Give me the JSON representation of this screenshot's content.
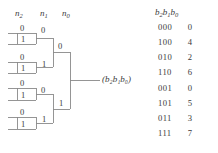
{
  "figure": {
    "type": "binary-decision-tree",
    "root_label": "(b₂b₁b₀)",
    "line_color": "#8a8a8a",
    "text_color": "#3a3a3a",
    "background": "#ffffff"
  },
  "headers": [
    {
      "name": "n2",
      "base": "n",
      "sub": "2"
    },
    {
      "name": "n1",
      "base": "n",
      "sub": "1"
    },
    {
      "name": "n0",
      "base": "n",
      "sub": "0"
    }
  ],
  "tree": {
    "leaf_groups": [
      {
        "id": "g1",
        "top_label": "0",
        "bottom_label": "1"
      },
      {
        "id": "g2",
        "top_label": "0",
        "bottom_label": "1"
      },
      {
        "id": "g3",
        "top_label": "0",
        "bottom_label": "1"
      },
      {
        "id": "g4",
        "top_label": "0",
        "bottom_label": "1"
      }
    ],
    "level2_labels": [
      {
        "id": "n1-a",
        "label": "0"
      },
      {
        "id": "n1-b",
        "label": "1"
      },
      {
        "id": "n1-c",
        "label": "0"
      },
      {
        "id": "n1-d",
        "label": "1"
      }
    ],
    "level3_labels": [
      {
        "id": "n2-top",
        "label": "0"
      },
      {
        "id": "n2-bottom",
        "label": "1"
      }
    ]
  },
  "table": {
    "header": {
      "text": "b₂b₁b₀",
      "base": "b",
      "subs": [
        "2",
        "1",
        "0"
      ]
    },
    "rows": [
      {
        "bits": "000",
        "value": "0"
      },
      {
        "bits": "100",
        "value": "4"
      },
      {
        "bits": "010",
        "value": "2"
      },
      {
        "bits": "110",
        "value": "6"
      },
      {
        "bits": "001",
        "value": "0"
      },
      {
        "bits": "101",
        "value": "5"
      },
      {
        "bits": "011",
        "value": "3"
      },
      {
        "bits": "111",
        "value": "7"
      }
    ]
  }
}
